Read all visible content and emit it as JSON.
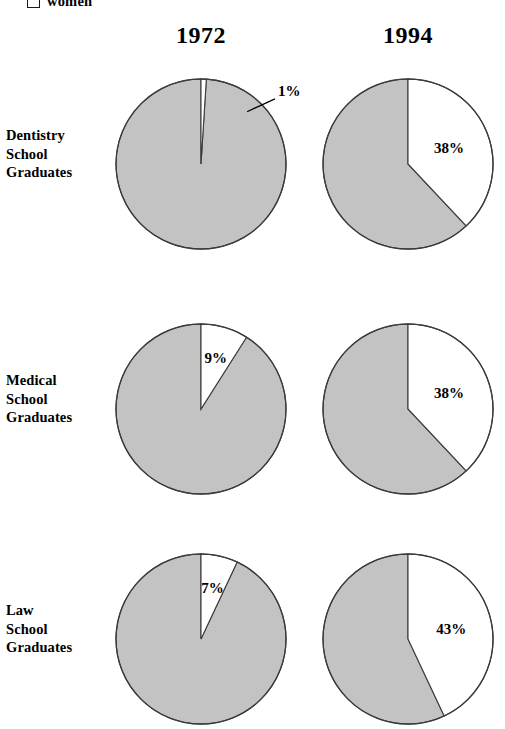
{
  "legend": {
    "swatch_icon": "empty-square-icon",
    "label": "women",
    "swatch_color": "#ffffff"
  },
  "colors": {
    "men_slice": "#c3c3c3",
    "women_slice": "#ffffff",
    "outline": "#3b3b3b",
    "text": "#000000",
    "background": "#ffffff"
  },
  "columns": [
    {
      "label": "1972"
    },
    {
      "label": "1994"
    }
  ],
  "rows": [
    {
      "label_lines": [
        "Dentistry",
        "School",
        "Graduates"
      ]
    },
    {
      "label_lines": [
        "Medical",
        "School",
        "Graduates"
      ]
    },
    {
      "label_lines": [
        "Law",
        "School",
        "Graduates"
      ]
    }
  ],
  "pies": [
    {
      "id": "dentistry-1972",
      "row": 0,
      "col": 0,
      "women_pct": 1,
      "label": "1%",
      "label_placement": "external-leader"
    },
    {
      "id": "dentistry-1994",
      "row": 0,
      "col": 1,
      "women_pct": 38,
      "label": "38%",
      "label_placement": "inside"
    },
    {
      "id": "medical-1972",
      "row": 1,
      "col": 0,
      "women_pct": 9,
      "label": "9%",
      "label_placement": "inside"
    },
    {
      "id": "medical-1994",
      "row": 1,
      "col": 1,
      "women_pct": 38,
      "label": "38%",
      "label_placement": "inside"
    },
    {
      "id": "law-1972",
      "row": 2,
      "col": 0,
      "women_pct": 7,
      "label": "7%",
      "label_placement": "inside"
    },
    {
      "id": "law-1994",
      "row": 2,
      "col": 1,
      "women_pct": 43,
      "label": "43%",
      "label_placement": "inside"
    }
  ],
  "chart_data": {
    "type": "pie",
    "title": "",
    "subtitle": "",
    "xlabel": "",
    "ylabel": "",
    "grid": false,
    "legend_position": "top-left",
    "legend_entries": [
      "women"
    ],
    "units": "percent",
    "series_names": [
      "women",
      "men"
    ],
    "columns": [
      "1972",
      "1994"
    ],
    "categories": [
      "Dentistry School Graduates",
      "Medical School Graduates",
      "Law School Graduates"
    ],
    "slice_start_angle_deg": 0,
    "slice_direction": "clockwise",
    "charts": [
      {
        "id": "dentistry-1972",
        "category": "Dentistry School Graduates",
        "year": "1972",
        "slices": [
          {
            "name": "women",
            "value": 1,
            "label": "1%",
            "color": "#ffffff"
          },
          {
            "name": "men",
            "value": 99,
            "label": "",
            "color": "#c3c3c3"
          }
        ]
      },
      {
        "id": "dentistry-1994",
        "category": "Dentistry School Graduates",
        "year": "1994",
        "slices": [
          {
            "name": "women",
            "value": 38,
            "label": "38%",
            "color": "#ffffff"
          },
          {
            "name": "men",
            "value": 62,
            "label": "",
            "color": "#c3c3c3"
          }
        ]
      },
      {
        "id": "medical-1972",
        "category": "Medical School Graduates",
        "year": "1972",
        "slices": [
          {
            "name": "women",
            "value": 9,
            "label": "9%",
            "color": "#ffffff"
          },
          {
            "name": "men",
            "value": 91,
            "label": "",
            "color": "#c3c3c3"
          }
        ]
      },
      {
        "id": "medical-1994",
        "category": "Medical School Graduates",
        "year": "1994",
        "slices": [
          {
            "name": "women",
            "value": 38,
            "label": "38%",
            "color": "#ffffff"
          },
          {
            "name": "men",
            "value": 62,
            "label": "",
            "color": "#c3c3c3"
          }
        ]
      },
      {
        "id": "law-1972",
        "category": "Law School Graduates",
        "year": "1972",
        "slices": [
          {
            "name": "women",
            "value": 7,
            "label": "7%",
            "color": "#ffffff"
          },
          {
            "name": "men",
            "value": 93,
            "label": "",
            "color": "#c3c3c3"
          }
        ]
      },
      {
        "id": "law-1994",
        "category": "Law School Graduates",
        "year": "1994",
        "slices": [
          {
            "name": "women",
            "value": 43,
            "label": "43%",
            "color": "#ffffff"
          },
          {
            "name": "men",
            "value": 57,
            "label": "",
            "color": "#c3c3c3"
          }
        ]
      }
    ]
  }
}
